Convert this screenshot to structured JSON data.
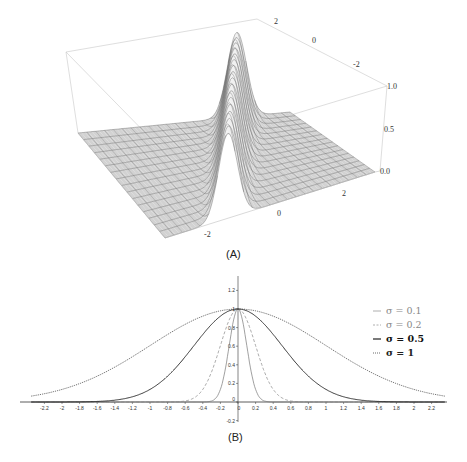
{
  "figure": {
    "panel_a_label": "(A)",
    "panel_b_label": "(B)"
  },
  "chart_data": [
    {
      "type": "surface3d",
      "title": "",
      "description": "3D surface plot of a Gaussian ridge, peak height 1.0, along a diagonal direction",
      "x_axis_ticks": [
        "-2",
        "0",
        "2"
      ],
      "y_axis_ticks": [
        "2",
        "0",
        "-2"
      ],
      "z_axis_ticks": [
        "0.0",
        "0.5",
        "1.0"
      ],
      "zlim": [
        0.0,
        1.0
      ],
      "grid": true
    },
    {
      "type": "line",
      "title": "",
      "xlabel": "",
      "ylabel": "",
      "xlim": [
        -2.35,
        2.35
      ],
      "ylim": [
        -0.2,
        1.35
      ],
      "x_ticks": [
        "-2.2",
        "-2",
        "-1.8",
        "-1.6",
        "-1.4",
        "-1.2",
        "-1",
        "-0.8",
        "-0.6",
        "-0.4",
        "-0.2",
        "0",
        "0.2",
        "0.4",
        "0.6",
        "0.8",
        "1",
        "1.2",
        "1.4",
        "1.6",
        "1.8",
        "2",
        "2.2"
      ],
      "y_ticks": [
        "-0.2",
        "0",
        "0.2",
        "0.4",
        "0.6",
        "0.8",
        "1",
        "1.2"
      ],
      "legend_position": "upper right",
      "function": "exp(-x^2 / (2*sigma^2))",
      "series": [
        {
          "name": "σ = 0.1",
          "sigma": 0.1,
          "style": "solid",
          "color": "#777777",
          "x": [
            -0.3,
            -0.2,
            -0.1,
            0,
            0.1,
            0.2,
            0.3
          ],
          "values": [
            0.01,
            0.14,
            0.61,
            1.0,
            0.61,
            0.14,
            0.01
          ]
        },
        {
          "name": "σ = 0.2",
          "sigma": 0.2,
          "style": "dashed",
          "color": "#888888",
          "x": [
            -0.6,
            -0.4,
            -0.2,
            0,
            0.2,
            0.4,
            0.6
          ],
          "values": [
            0.01,
            0.14,
            0.61,
            1.0,
            0.61,
            0.14,
            0.01
          ]
        },
        {
          "name": "σ = 0.5",
          "sigma": 0.5,
          "style": "solid-bold",
          "color": "#222222",
          "x": [
            -1.6,
            -1.2,
            -0.8,
            -0.4,
            0,
            0.4,
            0.8,
            1.2,
            1.6
          ],
          "values": [
            0.01,
            0.06,
            0.28,
            0.73,
            1.0,
            0.73,
            0.28,
            0.06,
            0.01
          ]
        },
        {
          "name": "σ = 1",
          "sigma": 1,
          "style": "dotted",
          "color": "#444444",
          "x": [
            -2.3,
            -2,
            -1.5,
            -1,
            -0.5,
            0,
            0.5,
            1,
            1.5,
            2,
            2.3
          ],
          "values": [
            0.07,
            0.14,
            0.32,
            0.61,
            0.88,
            1.0,
            0.88,
            0.61,
            0.32,
            0.14,
            0.07
          ]
        }
      ]
    }
  ],
  "legend": [
    {
      "label": "σ = 0.1",
      "marker": "—"
    },
    {
      "label": "σ = 0.2",
      "marker": "--"
    },
    {
      "label": "σ = 0.5",
      "marker": "—"
    },
    {
      "label": "σ = 1",
      "marker": "···"
    }
  ]
}
